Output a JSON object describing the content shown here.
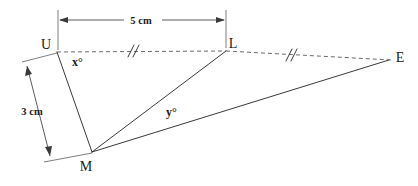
{
  "figure": {
    "kind": "geometry-diagram",
    "background_color": "#ffffff",
    "line_color": "#3a3a3a",
    "dashed_color": "#6b6b6b"
  },
  "vertices": [
    {
      "name": "U",
      "label": "U",
      "x": 57,
      "y": 52,
      "label_x": 46,
      "label_y": 49
    },
    {
      "name": "L",
      "label": "L",
      "x": 226,
      "y": 51,
      "label_x": 233,
      "label_y": 48
    },
    {
      "name": "E",
      "label": "E",
      "x": 389,
      "y": 60,
      "label_x": 397,
      "label_y": 60
    },
    {
      "name": "M",
      "label": "M",
      "x": 92,
      "y": 152,
      "label_x": 86,
      "label_y": 171
    }
  ],
  "segments": [
    {
      "name": "segment-U-M",
      "from": "U",
      "to": "M",
      "style": "solid"
    },
    {
      "name": "segment-M-L",
      "from": "M",
      "to": "L",
      "style": "solid"
    },
    {
      "name": "segment-M-E",
      "from": "M",
      "to": "E",
      "style": "solid"
    },
    {
      "name": "segment-U-L",
      "from": "U",
      "to": "L",
      "style": "dashed"
    },
    {
      "name": "segment-L-E",
      "from": "L",
      "to": "E",
      "style": "dashed"
    }
  ],
  "congruence_marks": [
    {
      "name": "tick-on-UL",
      "on_segment": "segment-U-L",
      "count": 2,
      "x": 131,
      "y": 51
    },
    {
      "name": "tick-on-LE",
      "on_segment": "segment-L-E",
      "count": 2,
      "x": 289,
      "y": 55
    }
  ],
  "angles": [
    {
      "name": "angle-x",
      "label": "x°",
      "at_vertex": "U",
      "x": 72,
      "y": 66
    },
    {
      "name": "angle-y",
      "label": "y°",
      "at_vertex": "M",
      "x": 166,
      "y": 116
    }
  ],
  "dimensions": [
    {
      "name": "dimension-5cm",
      "label": "5 cm",
      "value": 5,
      "unit": "cm",
      "measures": "U to L",
      "orientation": "horizontal",
      "label_x": 141,
      "label_y": 24,
      "line_x1": 60,
      "line_y1": 20,
      "line_x2": 224,
      "line_y2": 20
    },
    {
      "name": "dimension-3cm",
      "label": "3 cm",
      "value": 3,
      "unit": "cm",
      "measures": "U to M",
      "orientation": "oblique",
      "label_x": 32,
      "label_y": 115,
      "line_x1": 27,
      "line_y1": 66,
      "line_x2": 50,
      "line_y2": 156
    }
  ]
}
